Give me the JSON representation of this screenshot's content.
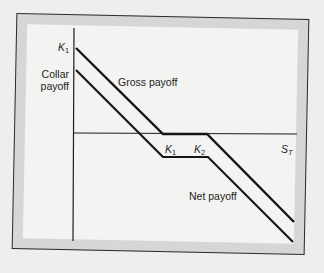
{
  "diagram": {
    "title": "",
    "axis": {
      "horizontal_label": "S",
      "horizontal_label_sub": "T",
      "vertical_tick_label": "K",
      "vertical_tick_label_sub": "1"
    },
    "strike_labels": [
      {
        "base": "K",
        "sub": "1"
      },
      {
        "base": "K",
        "sub": "2"
      }
    ],
    "curves": [
      {
        "name": "Gross payoff",
        "label": "Gross payoff"
      },
      {
        "name": "Net payoff",
        "label": "Net payoff"
      }
    ],
    "collar_label_line1": "Collar",
    "collar_label_line2": "payoff",
    "colors": {
      "line": "#151515",
      "frame_band": "#d6d6d4",
      "panel": "#f3f3f1"
    }
  }
}
